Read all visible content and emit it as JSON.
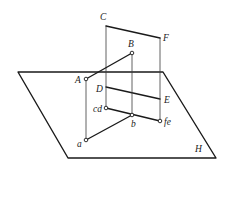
{
  "diagram": {
    "type": "descriptive-geometry-projection",
    "colors": {
      "stroke": "#1a1a1a",
      "background": "#ffffff"
    },
    "planes": {
      "H": {
        "label": "H",
        "corners": [
          [
            18,
            72
          ],
          [
            163,
            72
          ],
          [
            216,
            158
          ],
          [
            68,
            158
          ]
        ],
        "label_pos": [
          196,
          151
        ]
      },
      "vertical": {
        "corners": {
          "C": [
            106,
            26
          ],
          "F": [
            160,
            38
          ],
          "E": [
            160,
            99
          ],
          "D": [
            106,
            87
          ]
        }
      }
    },
    "points": {
      "A": {
        "label": "A",
        "pos": [
          86,
          79
        ],
        "label_pos": [
          75,
          83
        ]
      },
      "B": {
        "label": "B",
        "pos": [
          132,
          53
        ],
        "label_pos": [
          128,
          46
        ]
      },
      "C": {
        "label": "C",
        "pos": [
          106,
          26
        ],
        "label_pos": [
          100,
          20
        ]
      },
      "D": {
        "label": "D",
        "pos": [
          106,
          87
        ],
        "label_pos": [
          96,
          91
        ]
      },
      "E": {
        "label": "E",
        "pos": [
          160,
          99
        ],
        "label_pos": [
          163,
          103
        ]
      },
      "F": {
        "label": "F",
        "pos": [
          160,
          38
        ],
        "label_pos": [
          163,
          41
        ]
      },
      "a": {
        "label": "a",
        "pos": [
          86,
          140
        ],
        "label_pos": [
          77,
          147
        ]
      },
      "b": {
        "label": "b",
        "pos": [
          132,
          115
        ],
        "label_pos": [
          131,
          127
        ]
      },
      "cd": {
        "label": "cd",
        "pos": [
          106,
          108
        ],
        "label_pos": [
          93,
          112
        ]
      },
      "fe": {
        "label": "fe",
        "pos": [
          160,
          121
        ],
        "label_pos": [
          164,
          125
        ]
      }
    },
    "segments": [
      {
        "from": "A",
        "to": "B",
        "style": "thick"
      },
      {
        "from": "a",
        "to": "b",
        "style": "thick"
      },
      {
        "from": "cd",
        "to": "fe",
        "style": "thick"
      },
      {
        "from": "C",
        "to": "F",
        "style": "thick"
      },
      {
        "from": "D",
        "to": "E",
        "style": "thick"
      },
      {
        "from": "C",
        "to": "cd",
        "style": "thin"
      },
      {
        "from": "F",
        "to": "fe",
        "style": "thin"
      },
      {
        "from": "A",
        "to": "a",
        "style": "thin"
      },
      {
        "from": "B",
        "to": "b",
        "style": "thin"
      }
    ]
  }
}
